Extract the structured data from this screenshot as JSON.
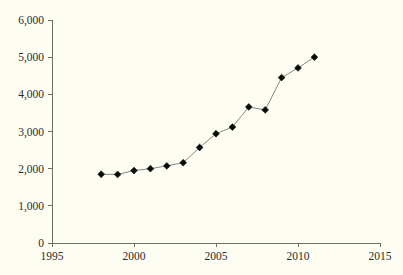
{
  "chart_data": {
    "type": "line",
    "title": "",
    "subtitle": "",
    "xlabel": "",
    "ylabel": "",
    "xlim": [
      1995,
      2015
    ],
    "ylim": [
      0,
      6000
    ],
    "grid": false,
    "legend": null,
    "marker": "filled-diamond",
    "x": [
      1998,
      1999,
      2000,
      2001,
      2002,
      2003,
      2004,
      2005,
      2006,
      2007,
      2008,
      2009,
      2010,
      2011
    ],
    "values": [
      1850,
      1845,
      1950,
      2000,
      2075,
      2160,
      2570,
      2940,
      3120,
      3660,
      3580,
      4450,
      4710,
      5000
    ],
    "series": [
      {
        "name": "series-1",
        "values": [
          1850,
          1845,
          1950,
          2000,
          2075,
          2160,
          2570,
          2940,
          3120,
          3660,
          3580,
          4450,
          4710,
          5000
        ]
      }
    ],
    "y_ticks": [
      0,
      1000,
      2000,
      3000,
      4000,
      5000,
      6000
    ],
    "y_tick_labels": [
      "0",
      "1,000",
      "2,000",
      "3,000",
      "4,000",
      "5,000",
      "6,000"
    ],
    "x_ticks": [
      1995,
      2000,
      2005,
      2010,
      2015
    ],
    "x_tick_labels": [
      "1995",
      "2000",
      "2005",
      "2010",
      "2015"
    ],
    "colors": {
      "background": "#fdfdf2",
      "axis": "#6f6f6a",
      "line": "#8a8a85",
      "marker": "#0a0a0a",
      "text": "#2b2b2b"
    }
  }
}
